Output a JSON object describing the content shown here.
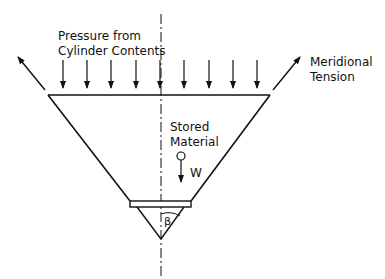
{
  "diagram": {
    "labels": {
      "pressure_line1": "Pressure from",
      "pressure_line2": "Cylinder Contents",
      "tension_line1": "Meridional",
      "tension_line2": "Tension",
      "stored_line1": "Stored",
      "stored_line2": "Material",
      "weight": "W",
      "angle": "β"
    },
    "pressure_arrow_count": 9,
    "colors": {
      "line": "#111111",
      "background": "#ffffff"
    }
  }
}
